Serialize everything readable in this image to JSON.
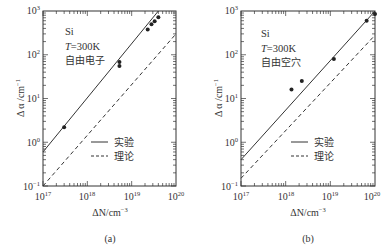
{
  "chart_data": [
    {
      "panel": "(a)",
      "type": "scatter",
      "title": "",
      "xlabel": "ΔN/cm⁻³",
      "ylabel": "Δα/cm⁻¹",
      "xscale": "log",
      "yscale": "log",
      "xlim": [
        1e+17,
        1e+20
      ],
      "ylim": [
        0.1,
        1000
      ],
      "x_ticks": [
        "10^17",
        "10^18",
        "10^19",
        "10^20"
      ],
      "y_ticks": [
        "10^-1",
        "10^0",
        "10^1",
        "10^2",
        "10^3"
      ],
      "grid": false,
      "annotation": [
        "Si",
        "T=300K",
        "自由电子"
      ],
      "legend": {
        "position": "lower right",
        "entries": [
          "实验",
          "理论"
        ]
      },
      "series": [
        {
          "name": "实验",
          "style": "solid",
          "kind": "line",
          "points": [
            [
              1e+17,
              0.6
            ],
            [
              4e+19,
              1000
            ]
          ]
        },
        {
          "name": "理论",
          "style": "dashed",
          "kind": "line",
          "points": [
            [
              1e+17,
              0.1
            ],
            [
              1e+20,
              300
            ]
          ]
        },
        {
          "name": "data",
          "kind": "scatter",
          "points": [
            [
              3e+17,
              2.2
            ],
            [
              5.3e+18,
              68
            ],
            [
              5.3e+18,
              55
            ],
            [
              2.3e+19,
              380
            ],
            [
              2.8e+19,
              500
            ],
            [
              3.3e+19,
              580
            ],
            [
              4e+19,
              720
            ]
          ]
        }
      ]
    },
    {
      "panel": "(b)",
      "type": "scatter",
      "title": "",
      "xlabel": "ΔN/cm⁻³",
      "ylabel": "Δα/cm⁻¹",
      "xscale": "log",
      "yscale": "log",
      "xlim": [
        1e+17,
        1e+20
      ],
      "ylim": [
        0.1,
        1000
      ],
      "x_ticks": [
        "10^17",
        "10^18",
        "10^19",
        "10^20"
      ],
      "y_ticks": [
        "10^-1",
        "10^0",
        "10^1",
        "10^2",
        "10^3"
      ],
      "grid": false,
      "annotation": [
        "Si",
        "T=300K",
        "自由空穴"
      ],
      "legend": {
        "position": "lower right",
        "entries": [
          "实验",
          "理论"
        ]
      },
      "series": [
        {
          "name": "实验",
          "style": "solid",
          "kind": "line",
          "points": [
            [
              1e+17,
              0.4
            ],
            [
              1e+20,
              1000
            ]
          ]
        },
        {
          "name": "理论",
          "style": "dashed",
          "kind": "line",
          "points": [
            [
              1e+17,
              0.15
            ],
            [
              1e+20,
              280
            ]
          ]
        },
        {
          "name": "data",
          "kind": "scatter",
          "points": [
            [
              1.35e+18,
              16
            ],
            [
              2.3e+18,
              25
            ],
            [
              1.2e+19,
              80
            ],
            [
              6.5e+19,
              600
            ],
            [
              1e+20,
              850
            ]
          ]
        }
      ]
    }
  ],
  "panels": [
    {
      "id": "a",
      "caption": "(a)",
      "ylabel": "Δ α /cm",
      "ylabel_exp": "−1",
      "xlabel_pre": "ΔN/cm",
      "xlabel_exp": "−3",
      "material": "Si",
      "temp_T": "T",
      "temp_val": "=300K",
      "carrier": "自由电子",
      "legend_exp": "实验",
      "legend_theory": "理论",
      "x_ticks": [
        {
          "base": "10",
          "exp": "17"
        },
        {
          "base": "10",
          "exp": "18"
        },
        {
          "base": "10",
          "exp": "19"
        },
        {
          "base": "10",
          "exp": "20"
        }
      ],
      "y_ticks": [
        {
          "base": "10",
          "exp": "3"
        },
        {
          "base": "10",
          "exp": "2"
        },
        {
          "base": "10",
          "exp": "1"
        },
        {
          "base": "10",
          "exp": "0"
        },
        {
          "base": "10",
          "exp": "−1"
        }
      ]
    },
    {
      "id": "b",
      "caption": "(b)",
      "ylabel": "Δ α /cm",
      "ylabel_exp": "−1",
      "xlabel_pre": "ΔN/cm",
      "xlabel_exp": "−3",
      "material": "Si",
      "temp_T": "T",
      "temp_val": "=300K",
      "carrier": "自由空穴",
      "legend_exp": "实验",
      "legend_theory": "理论",
      "x_ticks": [
        {
          "base": "10",
          "exp": "17"
        },
        {
          "base": "10",
          "exp": "18"
        },
        {
          "base": "10",
          "exp": "19"
        },
        {
          "base": "10",
          "exp": "20"
        }
      ],
      "y_ticks": [
        {
          "base": "10",
          "exp": "3"
        },
        {
          "base": "10",
          "exp": "2"
        },
        {
          "base": "10",
          "exp": "1"
        },
        {
          "base": "10",
          "exp": "0"
        },
        {
          "base": "10",
          "exp": "−1"
        }
      ]
    }
  ],
  "colors": {
    "ink": "#2a2a2a",
    "background": "#ffffff"
  }
}
